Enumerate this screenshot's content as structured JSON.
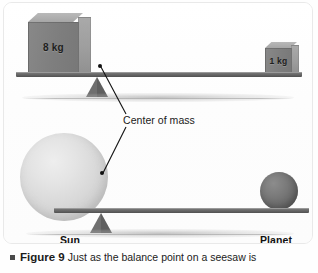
{
  "figure": {
    "panel": {
      "top_diagram": {
        "name": "seesaw-with-weights",
        "left_weight_label": "8 kg",
        "right_weight_label": "1 kg"
      },
      "bottom_diagram": {
        "name": "sun-planet-seesaw",
        "left_body_label": "Sun",
        "right_body_label": "Planet"
      },
      "annotation": {
        "center_of_mass_label": "Center of mass"
      }
    },
    "caption": {
      "bullet": "square-bullet",
      "figure_number": "Figure 9",
      "text": "Just as the balance point on a seesaw is"
    },
    "colors": {
      "beam": "#6b6b6b",
      "fulcrum": "#6f6f6f",
      "box_front": "#7e7e7e",
      "box_side": "#9d9d9d",
      "sun": "#d8d8d8",
      "planet": "#6d6d6d",
      "dot": "#111111",
      "text": "#1a1a1a",
      "panel_bg": "#ffffff"
    }
  }
}
